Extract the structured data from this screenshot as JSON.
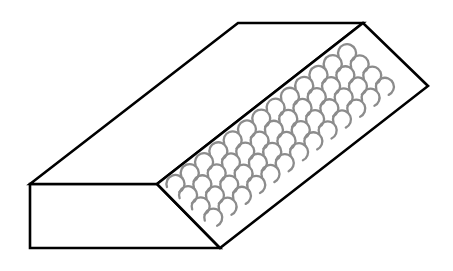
{
  "figure": {
    "colors": {
      "background": "#ffffff",
      "outline": "#000000",
      "texture": "#8c8c8c"
    },
    "faces": {
      "front": [
        [
          30,
          184
        ],
        [
          157,
          184
        ],
        [
          220,
          248
        ],
        [
          30,
          248
        ]
      ],
      "top": [
        [
          30,
          184
        ],
        [
          238,
          23
        ],
        [
          363,
          23
        ],
        [
          157,
          184
        ]
      ],
      "textured": [
        [
          157,
          184
        ],
        [
          363,
          23
        ],
        [
          428,
          86
        ],
        [
          220,
          248
        ]
      ]
    },
    "texture_pattern": {
      "type": "scalloped-arcs",
      "origin": [
        167,
        187
      ],
      "row_step": [
        14.3,
        -10.9
      ],
      "column_step": [
        12.6,
        11.2
      ],
      "columns_along_length": 13,
      "rows_across_width": 4,
      "arc_radius": 9
    }
  }
}
